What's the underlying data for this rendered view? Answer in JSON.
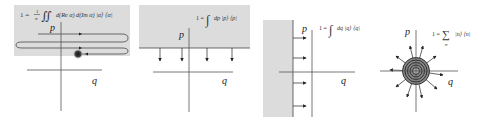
{
  "colors": {
    "shade": "#dcdcdc",
    "axis": "#555555",
    "ink": "#222222",
    "blob": "#333333"
  },
  "panels": [
    {
      "name": "coherent-states",
      "formula": "1 = 1/π ∬ d(Re α) d(Im α) |α⟩⟨α|",
      "formula_parts": {
        "lhs": "1 =",
        "frac_num": "1",
        "frac_den": "π",
        "integral": "∬",
        "integrand": "d(Re α) d(Im α) |α⟩ ⟨α|"
      },
      "axis_labels": {
        "vertical": "p",
        "horizontal": "q"
      }
    },
    {
      "name": "momentum-states",
      "formula": "1 = ∫ dp |p⟩⟨p|",
      "formula_parts": {
        "lhs": "1 =",
        "integral": "∫",
        "integrand": "dp |p⟩ ⟨p|"
      },
      "axis_labels": {
        "vertical": "p",
        "horizontal": "q"
      }
    },
    {
      "name": "position-states",
      "formula": "1 = ∫ dq |q⟩⟨q|",
      "formula_parts": {
        "lhs": "1 =",
        "integral": "∫",
        "integrand": "dq |q⟩ ⟨q|"
      },
      "axis_labels": {
        "vertical": "p",
        "horizontal": "q"
      }
    },
    {
      "name": "number-states",
      "formula": "1 = Σ_n |n⟩⟨n|",
      "formula_parts": {
        "lhs": "1 =",
        "sum": "∑",
        "sum_index": "n",
        "summand": "|n⟩ ⟨n|"
      },
      "axis_labels": {
        "vertical": "p",
        "horizontal": "q"
      }
    }
  ]
}
